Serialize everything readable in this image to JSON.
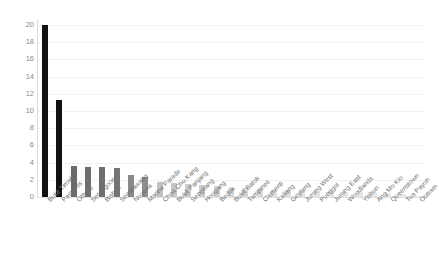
{
  "chart_data": {
    "type": "bar",
    "title": "",
    "subtitle": "",
    "xlabel": "",
    "ylabel": "",
    "ylim": [
      0,
      20
    ],
    "yticks": [
      0,
      2,
      4,
      6,
      8,
      10,
      12,
      14,
      16,
      18,
      20
    ],
    "grid": true,
    "legend": "none",
    "orientation": "vertical",
    "categories": [
      "Bukit Timah",
      "Pasir Ris",
      "Others",
      "Serangoon",
      "Bishan",
      "Sembawang",
      "Novena",
      "Marine Parade",
      "Choa Chu Kang",
      "Bukit Panjang",
      "Sengkang",
      "Hougang",
      "Bedok",
      "Bukit Batok",
      "Tampines",
      "Clementi",
      "Kallang",
      "Geylang",
      "Jurong West",
      "Punggol",
      "Jurong East",
      "Woodlands",
      "Yishun",
      "Ang Mo Kio",
      "Queenstown",
      "Toa Payoh",
      "Outram"
    ],
    "values": [
      20.0,
      11.3,
      3.6,
      3.5,
      3.5,
      3.4,
      2.6,
      2.3,
      1.7,
      1.6,
      1.5,
      1.4,
      1.3,
      1.1,
      1.0,
      0.9,
      0.85,
      0.8,
      0.75,
      0.7,
      0.65,
      0.6,
      0.55,
      0.5,
      0.45,
      0.3,
      0.15
    ],
    "bar_colors": [
      "#111111",
      "#111111",
      "#6b6b6b",
      "#6e6e6e",
      "#6f6f6f",
      "#757575",
      "#8a8a8a",
      "#8f8f8f",
      "#c2c2c2",
      "#c6c6c6",
      "#cacaca",
      "#cdcdcd",
      "#d0d0d0",
      "#d4d4d4",
      "#d7d7d7",
      "#dadada",
      "#dcdcdc",
      "#dedede",
      "#e0e0e0",
      "#e1e1e1",
      "#e3e3e3",
      "#e4e4e4",
      "#e5e5e5",
      "#e6e6e6",
      "#e7e7e7",
      "#e8e8e8",
      "#eaeaea"
    ]
  },
  "axis": {
    "y_tick_color": "#8a8a8a",
    "x_tick_color": "#6e6e6e",
    "gridline_color": "#f2f2f2"
  }
}
